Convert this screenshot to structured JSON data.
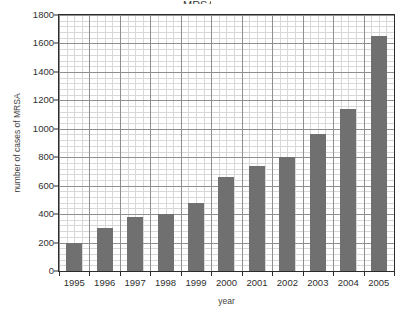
{
  "title_fragment": "MRSA",
  "chart_data": {
    "type": "bar",
    "title": "",
    "xlabel": "year",
    "ylabel": "number of cases of MRSA",
    "categories": [
      "1995",
      "1996",
      "1997",
      "1998",
      "1999",
      "2000",
      "2001",
      "2002",
      "2003",
      "2004",
      "2005"
    ],
    "values": [
      200,
      300,
      380,
      400,
      480,
      660,
      740,
      800,
      960,
      1140,
      1650
    ],
    "series": [
      {
        "name": "number of cases of MRSA",
        "values": [
          200,
          300,
          380,
          400,
          480,
          660,
          740,
          800,
          960,
          1140,
          1650
        ]
      }
    ],
    "ylim": [
      0,
      1800
    ],
    "y_major_ticks": [
      0,
      200,
      400,
      600,
      800,
      1000,
      1200,
      1400,
      1600,
      1800
    ],
    "y_tick_labels": [
      "0",
      "200",
      "400",
      "600",
      "800",
      "1000",
      "1200",
      "1400",
      "1600",
      "1800"
    ],
    "y_minor_step": 40,
    "grid": true,
    "legend": false,
    "legend_position": "none",
    "bar_color": "#707070",
    "grid_minor_color": "#d8d8d8",
    "grid_major_color": "#8f8f8f",
    "axis_color": "#2b2b2b",
    "background_color": "#ffffff"
  }
}
